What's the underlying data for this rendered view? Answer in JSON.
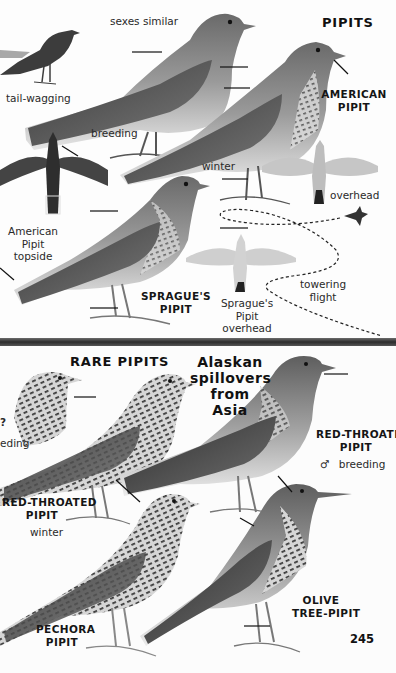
{
  "page": {
    "number": "245",
    "colors": {
      "background": "#fdfdfd",
      "ink": "#1e1e1e",
      "divider": "#3a3a3a",
      "bird_dark": "#3a3a3a",
      "bird_mid": "#8a8a8a",
      "bird_light": "#d8d8d8"
    }
  },
  "top_plate": {
    "title": "PIPITS",
    "labels": {
      "sexes_similar": "sexes similar",
      "tail_wagging": "tail-wagging",
      "breeding": "breeding",
      "winter": "winter",
      "overhead": "overhead",
      "american_topside_1": "American",
      "american_topside_2": "Pipit",
      "american_topside_3": "topside",
      "towering_1": "towering",
      "towering_2": "flight",
      "spragues_overhead_1": "Sprague's",
      "spragues_overhead_2": "Pipit",
      "spragues_overhead_3": "overhead"
    },
    "species": {
      "american_1": "AMERICAN",
      "american_2": "PIPIT",
      "spragues_1": "SPRAGUE'S",
      "spragues_2": "PIPIT"
    },
    "icons": [
      "silhouette-bird-icon",
      "flight-path-icon",
      "flying-bird-silhouette-icon"
    ]
  },
  "bottom_plate": {
    "title": "RARE PIPITS",
    "subtitle_1": "Alaskan",
    "subtitle_2": "spillovers",
    "subtitle_3": "from",
    "subtitle_4": "Asia",
    "labels": {
      "edge_partial_symbol": "?",
      "edge_partial_text": "eding",
      "male_symbol": "♂",
      "breeding": "breeding",
      "winter": "winter"
    },
    "species": {
      "red_throated_breeding_1": "RED-THROATED",
      "red_throated_breeding_2": "PIPIT",
      "red_throated_winter_1": "RED-THROATED",
      "red_throated_winter_2": "PIPIT",
      "pechora_1": "PECHORA",
      "pechora_2": "PIPIT",
      "olive_1": "OLIVE",
      "olive_2": "TREE-PIPIT"
    }
  }
}
